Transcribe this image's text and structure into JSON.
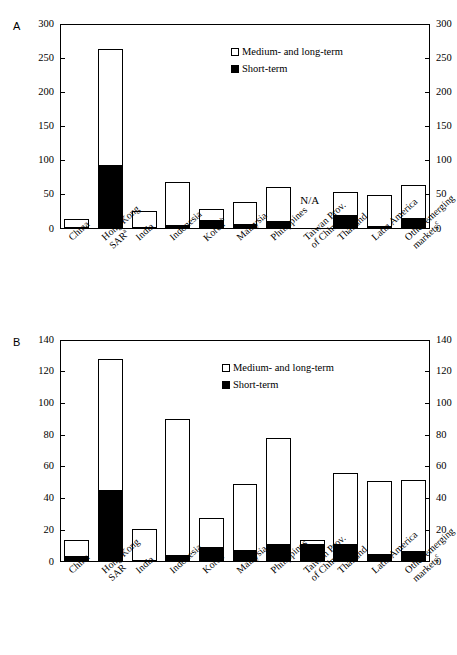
{
  "figure": {
    "panels": [
      "A",
      "B"
    ],
    "na_text": "N/A",
    "caption": ""
  },
  "legend": {
    "items": [
      {
        "label": "Medium- and long-term",
        "swatch": "open",
        "color": "#ffffff"
      },
      {
        "label": "Short-term",
        "swatch": "filled",
        "color": "#000000"
      }
    ]
  },
  "chart_data": [
    {
      "type": "bar",
      "panel": "A",
      "title": "",
      "xlabel": "",
      "ylabel": "",
      "ylim": [
        0,
        300
      ],
      "yticks": [
        0,
        50,
        100,
        150,
        200,
        250,
        300
      ],
      "ytick_labels": [
        "0",
        "50",
        "100",
        "150",
        "200",
        "250",
        "300"
      ],
      "grid": false,
      "stacked": true,
      "legend_position": "upper-center-right",
      "categories": [
        "China",
        "Hong Kong SAR",
        "India",
        "Indonesia",
        "Korea",
        "Malaysia",
        "Philippines",
        "Taiwan Prov. of China",
        "Thailand",
        "Latin America",
        "Other emerging markets"
      ],
      "category_footnotes": [
        "",
        "a",
        "",
        "",
        "b",
        "",
        "",
        "",
        "",
        "",
        "c"
      ],
      "category_lines": [
        [
          "China"
        ],
        [
          "Hong Kong",
          "SAR"
        ],
        [
          "India"
        ],
        [
          "Indonesia"
        ],
        [
          "Korea"
        ],
        [
          "Malaysia"
        ],
        [
          "Philippines"
        ],
        [
          "Taiwan Prov.",
          "of China"
        ],
        [
          "Thailand"
        ],
        [
          "Latin America"
        ],
        [
          "Other emerging",
          "markets"
        ]
      ],
      "series": [
        {
          "name": "Short-term",
          "values": [
            2,
            92,
            1,
            5,
            11,
            6,
            10,
            null,
            19,
            3,
            15
          ]
        },
        {
          "name": "Medium- and long-term",
          "values": [
            12,
            172,
            26,
            64,
            18,
            34,
            51,
            null,
            35,
            47,
            50
          ]
        }
      ],
      "totals": [
        14,
        264,
        27,
        69,
        29,
        40,
        61,
        null,
        54,
        50,
        65
      ],
      "annotations": [
        {
          "text": "N/A",
          "category": "Taiwan Prov. of China",
          "y": 40
        }
      ]
    },
    {
      "type": "bar",
      "panel": "B",
      "title": "",
      "xlabel": "",
      "ylabel": "",
      "ylim": [
        0,
        140
      ],
      "yticks": [
        0,
        20,
        40,
        60,
        80,
        100,
        120,
        140
      ],
      "ytick_labels": [
        "0",
        "20",
        "40",
        "60",
        "80",
        "100",
        "120",
        "140"
      ],
      "grid": false,
      "stacked": true,
      "legend_position": "upper-center-right",
      "categories": [
        "China",
        "Hong Kong SAR",
        "India",
        "Indonesia",
        "Korea",
        "Malaysia",
        "Philippines",
        "Taiwan Prov. of China",
        "Thailand",
        "Latin America",
        "Other emerging markets"
      ],
      "category_footnotes": [
        "",
        "",
        "",
        "",
        "",
        "",
        "",
        "",
        "",
        "",
        "c"
      ],
      "category_lines": [
        [
          "China"
        ],
        [
          "Hong Kong",
          "SAR"
        ],
        [
          "India"
        ],
        [
          "Indonesia"
        ],
        [
          "Korea"
        ],
        [
          "Malaysia"
        ],
        [
          "Philippines"
        ],
        [
          "Taiwan Prov.",
          "of China"
        ],
        [
          "Thailand"
        ],
        [
          "Latin America"
        ],
        [
          "Other emerging",
          "markets"
        ]
      ],
      "series": [
        {
          "name": "Short-term",
          "values": [
            3,
            45,
            0.5,
            3.5,
            9,
            7,
            11,
            10.5,
            10.5,
            4.5,
            6
          ]
        },
        {
          "name": "Medium- and long-term",
          "values": [
            11,
            83,
            20.5,
            86.5,
            19,
            42.5,
            67.5,
            3.5,
            45.5,
            46.5,
            46
          ]
        }
      ],
      "totals": [
        14,
        128,
        21,
        90,
        28,
        49.5,
        78.5,
        14,
        56,
        51,
        52
      ],
      "annotations": []
    }
  ]
}
